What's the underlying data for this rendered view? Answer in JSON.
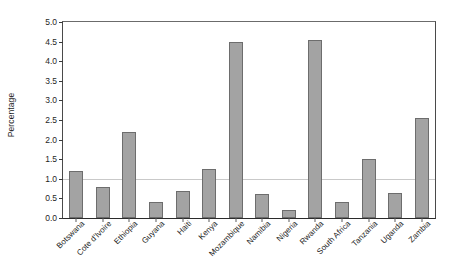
{
  "chart_data": {
    "type": "bar",
    "title": "",
    "xlabel": "",
    "ylabel": "Percentage",
    "ylim": [
      0.0,
      5.0
    ],
    "ytick_interval": 0.5,
    "yticks": [
      "5.0",
      "4.5",
      "4.0",
      "3.5",
      "3.0",
      "2.5",
      "2.0",
      "1.5",
      "1.0",
      "0.5",
      "0.0"
    ],
    "ytick_values": [
      5.0,
      4.5,
      4.0,
      3.5,
      3.0,
      2.5,
      2.0,
      1.5,
      1.0,
      0.5,
      0.0
    ],
    "grid": "single horizontal gridline at y=1.0",
    "gridlines": [
      1.0
    ],
    "legend": "none",
    "legend_position": "none",
    "bar_color": "#a3a3a3",
    "bar_edge_color": "#6d6d6d",
    "gridline_color": "#c9c9c9",
    "axis_color": "#2b2b2b",
    "categories": [
      "Botswana",
      "Cote d'Ivoire",
      "Ethiopia",
      "Guyana",
      "Haiti",
      "Kenya",
      "Mozambique",
      "Namibia",
      "Nigeria",
      "Rwanda",
      "South Africa",
      "Tanzania",
      "Uganda",
      "Zambia"
    ],
    "values": [
      1.2,
      0.8,
      2.2,
      0.4,
      0.7,
      1.25,
      4.5,
      0.6,
      0.2,
      4.55,
      0.4,
      1.5,
      0.65,
      2.55
    ],
    "annotations": []
  }
}
